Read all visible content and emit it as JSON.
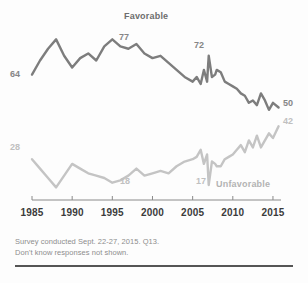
{
  "chart_data": {
    "type": "line",
    "title": "Favorable",
    "xlabel": "",
    "ylabel": "",
    "xlim": [
      1985,
      2016
    ],
    "ylim": [
      0,
      100
    ],
    "grid": false,
    "legend_position": "inline-series-labels",
    "tick_labels": [
      "1985",
      "1990",
      "1995",
      "2000",
      "2005",
      "2010",
      "2015"
    ],
    "tick_values": [
      1985,
      1990,
      1995,
      2000,
      2005,
      2010,
      2015
    ],
    "series": [
      {
        "name": "Favorable",
        "color": "#7d7d7d",
        "x": [
          1985,
          1986,
          1987,
          1988,
          1989,
          1990,
          1991,
          1992,
          1993,
          1994,
          1995,
          1996,
          1997,
          1998,
          1999,
          2000,
          2001,
          2002,
          2003,
          2004,
          2005,
          2005.5,
          2006,
          2006.4,
          2006.8,
          2007,
          2007.4,
          2007.8,
          2008,
          2008.5,
          2009,
          2009.5,
          2010,
          2010.5,
          2011,
          2011.5,
          2012,
          2012.5,
          2013,
          2013.5,
          2014,
          2014.5,
          2015,
          2015.7
        ],
        "values": [
          64,
          70,
          75,
          79,
          72,
          67,
          71,
          73,
          70,
          76,
          79,
          76,
          75,
          77,
          73,
          71,
          72,
          69,
          66,
          63,
          61,
          63,
          60,
          66,
          61,
          72,
          63,
          64,
          66,
          65,
          61,
          60,
          59,
          58,
          56,
          55,
          52,
          53,
          51,
          56,
          53,
          49,
          52,
          50
        ]
      },
      {
        "name": "Unfavorable",
        "color": "#c4c4c4",
        "x": [
          1985,
          1986,
          1987,
          1988,
          1989,
          1990,
          1991,
          1992,
          1993,
          1994,
          1995,
          1996,
          1997,
          1998,
          1999,
          2000,
          2001,
          2002,
          2003,
          2004,
          2005,
          2005.5,
          2006,
          2006.4,
          2006.8,
          2007,
          2007.4,
          2007.8,
          2008,
          2008.5,
          2009,
          2009.5,
          2010,
          2010.5,
          2011,
          2011.5,
          2012,
          2012.5,
          2013,
          2013.5,
          2014,
          2014.5,
          2015,
          2015.7
        ],
        "values": [
          28,
          24,
          20,
          16,
          21,
          26,
          24,
          22,
          21,
          20,
          18,
          19,
          21,
          24,
          21,
          22,
          23,
          22,
          25,
          27,
          28,
          29,
          32,
          26,
          30,
          17,
          27,
          26,
          25,
          25,
          28,
          29,
          30,
          32,
          34,
          31,
          36,
          33,
          38,
          33,
          36,
          39,
          37,
          42
        ]
      }
    ],
    "point_labels": [
      {
        "series": "Favorable",
        "value": "64",
        "year": 1985,
        "align": "left"
      },
      {
        "series": "Favorable",
        "value": "77",
        "year": 1997,
        "align": "top"
      },
      {
        "series": "Favorable",
        "value": "72",
        "year": 2007,
        "align": "top"
      },
      {
        "series": "Favorable",
        "value": "50",
        "year": 2015.7,
        "align": "right"
      },
      {
        "series": "Unfavorable",
        "value": "28",
        "year": 1985,
        "align": "left"
      },
      {
        "series": "Unfavorable",
        "value": "18",
        "year": 1995,
        "align": "bottom"
      },
      {
        "series": "Unfavorable",
        "value": "17",
        "year": 2007,
        "align": "bottom"
      },
      {
        "series": "Unfavorable",
        "value": "42",
        "year": 2015.7,
        "align": "right"
      }
    ]
  },
  "labels": {
    "favorable_title": "Favorable",
    "unfavorable_title": "Unfavorable",
    "fav_start": "64",
    "fav_peak": "77",
    "fav_spike": "72",
    "fav_end": "50",
    "unfav_start": "28",
    "unfav_low1": "18",
    "unfav_low2": "17",
    "unfav_end": "42"
  },
  "axis": {
    "ticks": [
      "1985",
      "1990",
      "1995",
      "2000",
      "2005",
      "2010",
      "2015"
    ]
  },
  "footnote": {
    "line1": "Survey conducted Sept. 22-27, 2015. Q13.",
    "line2": "Don't know responses not shown."
  },
  "colors": {
    "favorable": "#7d7d7d",
    "unfavorable": "#c4c4c4",
    "axis": "#8a8a8a",
    "tick_text": "#3b3b3b",
    "footnote_text": "#8d8d8d",
    "rule": "#555555",
    "background": "#fdfdfd"
  }
}
